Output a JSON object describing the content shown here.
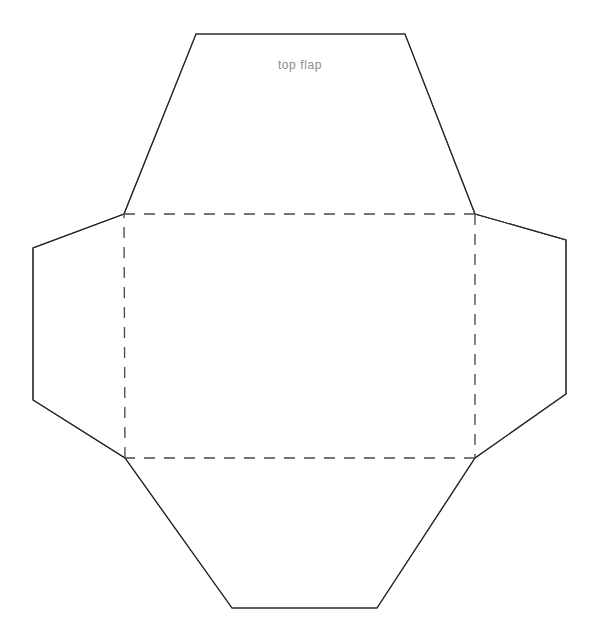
{
  "document": {
    "title": "Envelope Template",
    "background_color": "#ffffff",
    "width": 599,
    "height": 640
  },
  "style": {
    "cut_line_color": "#2b2b2b",
    "fold_line_color": "#4a4a4a",
    "label_color": "#8d8d8d",
    "cut_line_width": 1.15,
    "fold_line_width": 1.35,
    "fold_dash_pattern": "11 9"
  },
  "labels": {
    "top_flap": "top flap",
    "top_flap_x": 300,
    "top_flap_y": 69
  },
  "geometry": {
    "base_rectangle": {
      "name": "envelope-body-fold-rectangle",
      "top_left": [
        124,
        214
      ],
      "top_right": [
        475,
        214
      ],
      "bottom_right": [
        475,
        458
      ],
      "bottom_left": [
        125,
        458
      ],
      "path": "M 124 214 L 475 214 L 475 458 L 125 458 Z"
    },
    "fold_lines": {
      "top": "M 124 214 L 475 214",
      "right": "M 475 214 L 475 458",
      "bottom": "M 475 458 L 125 458",
      "left": "M 125 458 L 124 214"
    },
    "top_flap": {
      "name": "top-flap",
      "vertices": [
        [
          124,
          214
        ],
        [
          196,
          34
        ],
        [
          405,
          34
        ],
        [
          475,
          214
        ]
      ],
      "path": "M 124 214 L 196 34 L 405 34 L 475 214"
    },
    "left_flap": {
      "name": "left-flap",
      "vertices": [
        [
          124,
          214
        ],
        [
          33,
          248
        ],
        [
          33,
          400
        ],
        [
          125,
          458
        ]
      ],
      "path": "M 124 214 L 33 248 L 33 400 L 125 458"
    },
    "right_flap": {
      "name": "right-flap",
      "vertices": [
        [
          475,
          214
        ],
        [
          566,
          240
        ],
        [
          566,
          394
        ],
        [
          475,
          458
        ]
      ],
      "path": "M 475 214 L 566 240 L 566 394 L 475 458"
    },
    "bottom_flap": {
      "name": "bottom-flap",
      "vertices": [
        [
          125,
          458
        ],
        [
          232,
          608
        ],
        [
          377,
          608
        ],
        [
          475,
          458
        ]
      ],
      "path": "M 125 458 L 232 608 L 377 608 L 475 458"
    },
    "outline_path": "M 196 34 L 405 34 L 475 214 L 566 240 L 566 394 L 475 458 L 377 608 L 232 608 L 125 458 L 33 400 L 33 248 L 124 214 Z"
  }
}
